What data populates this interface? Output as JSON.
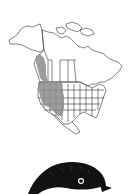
{
  "figure": {
    "type": "range-map-with-illustration",
    "map": {
      "region": "North America",
      "range_fill_color": "#8c8c8c",
      "outline_color": "#333333",
      "shaded_areas": [
        "Pacific coast of Alaska/British Columbia",
        "Western United States"
      ]
    },
    "illustration": {
      "subject": "chickadee head",
      "colors": {
        "cap": "#111111",
        "cheek": "#ffffff"
      }
    }
  }
}
